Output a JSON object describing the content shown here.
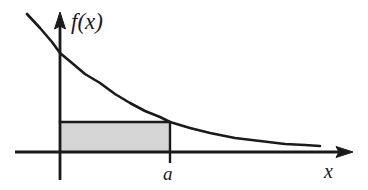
{
  "figure": {
    "background_color": "#ffffff",
    "ink_color": "#1a1a1a",
    "shade_color": "#d5d5d5"
  },
  "axes": {
    "y_axis": {
      "name": "vertical-axis",
      "label": "f(x)",
      "x": 60,
      "top": 13,
      "bottom": 180,
      "arrow": "up"
    },
    "x_axis": {
      "name": "horizontal-axis",
      "label": "x",
      "y": 152,
      "left": 15,
      "right": 352,
      "arrow": "right"
    }
  },
  "labels": {
    "function_label": "f(x)",
    "x_axis_label": "x",
    "tick_label_a": "a"
  },
  "chart_data": {
    "type": "line",
    "title": "",
    "xlabel": "x",
    "ylabel": "f(x)",
    "grid": false,
    "legend": null,
    "series": [
      {
        "name": "f(x)",
        "kind": "decreasing-convex-curve",
        "stroke_width": 2.6,
        "points": [
          [
            27,
            14
          ],
          [
            40,
            28
          ],
          [
            52,
            42
          ],
          [
            60,
            53
          ],
          [
            72,
            63
          ],
          [
            85,
            74
          ],
          [
            100,
            83
          ],
          [
            115,
            94
          ],
          [
            130,
            103
          ],
          [
            145,
            111
          ],
          [
            160,
            117
          ],
          [
            170,
            122
          ],
          [
            190,
            128
          ],
          [
            210,
            133
          ],
          [
            235,
            138
          ],
          [
            260,
            141
          ],
          [
            285,
            144
          ],
          [
            305,
            145
          ],
          [
            320,
            146
          ]
        ]
      }
    ],
    "annotations": [
      {
        "name": "shaded-rectangle",
        "kind": "rect",
        "fill": "#d5d5d5",
        "stroke": "#1a1a1a",
        "x0": 60,
        "x1": 170,
        "y_top": 122,
        "y_bottom": 152,
        "meaning": "rectangle of width a and height f(a)"
      },
      {
        "name": "tick-a",
        "kind": "vertical-tick",
        "x": 170,
        "y_top": 122,
        "y_bottom": 163,
        "label": "a"
      }
    ],
    "axis_ranges": {
      "x": [
        0,
        1
      ],
      "y": [
        0,
        1
      ]
    }
  }
}
